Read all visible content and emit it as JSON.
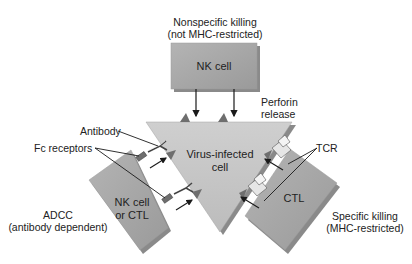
{
  "diagram": {
    "title_top": {
      "line1": "Nonspecific killing",
      "line2": "(not MHC-restricted)"
    },
    "nk_cell_top": {
      "label": "NK cell"
    },
    "perforin": {
      "line1": "Perforin",
      "line2": "release"
    },
    "virus_cell": {
      "line1": "Virus-infected",
      "line2": "cell"
    },
    "antibody_label": "Antibody",
    "fc_receptors_label": "Fc receptors",
    "left_cell": {
      "line1": "NK cell",
      "line2": "or CTL"
    },
    "adcc": {
      "line1": "ADCC",
      "line2": "(antibody dependent)"
    },
    "tcr_label": "TCR",
    "right_cell": {
      "label": "CTL"
    },
    "specific": {
      "line1": "Specific killing",
      "line2": "(MHC-restricted)"
    },
    "colors": {
      "cell_fill": "#a8a8a8",
      "triangle_fill": "#c4c4c4",
      "shadow": "#7a7a7a",
      "line": "#1a1a1a",
      "receptor_light": "#e6e6e6",
      "receptor_dark": "#6e6e6e"
    }
  }
}
